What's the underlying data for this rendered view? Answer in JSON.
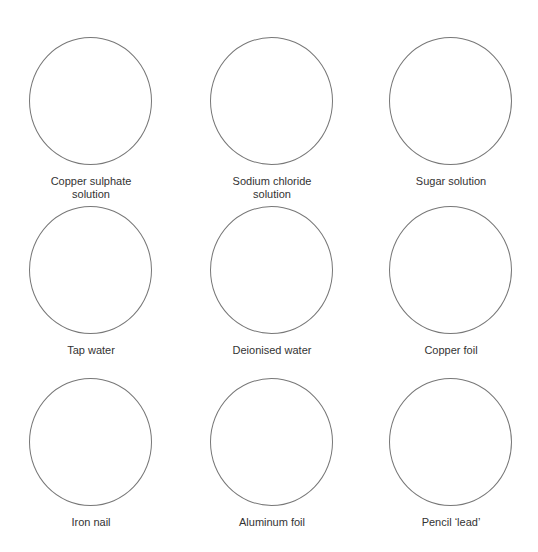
{
  "diagram": {
    "layout": "3x3 grid of empty circles with captions",
    "items": [
      {
        "label": "Copper sulphate\nsolution"
      },
      {
        "label": "Sodium chloride\nsolution"
      },
      {
        "label": "Sugar solution"
      },
      {
        "label": "Tap water"
      },
      {
        "label": "Deionised water"
      },
      {
        "label": "Copper foil"
      },
      {
        "label": "Iron nail"
      },
      {
        "label": "Aluminum foil"
      },
      {
        "label": "Pencil ‘lead’"
      }
    ],
    "colors": {
      "circle_stroke": "#777777",
      "label_text": "#333333",
      "background": "#ffffff"
    }
  }
}
